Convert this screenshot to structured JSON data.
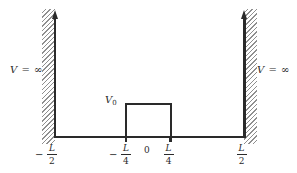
{
  "figure": {
    "type": "potential-energy-diagram",
    "left_wall_label": {
      "variable": "V",
      "relation": "= ∞"
    },
    "right_wall_label": {
      "variable": "V",
      "relation": "= ∞"
    },
    "barrier_label": {
      "variable": "V",
      "subscript": "0"
    },
    "axis_labels": {
      "neg_half": {
        "sign": "−",
        "numerator": "L",
        "denominator": "2"
      },
      "neg_quarter": {
        "sign": "−",
        "numerator": "L",
        "denominator": "4"
      },
      "origin": "0",
      "pos_quarter": {
        "numerator": "L",
        "denominator": "4"
      },
      "pos_half": {
        "numerator": "L",
        "denominator": "2"
      }
    },
    "colors": {
      "line": "#2a2a2a",
      "hatch": "#8f8f8f",
      "background": "#ffffff"
    }
  }
}
